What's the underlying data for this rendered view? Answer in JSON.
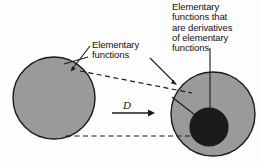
{
  "figure": {
    "background_color": "#fdfdfd",
    "labels": {
      "derivatives": "Elementary\nfunctions that\nare derivatives\nof elementary\nfunctions",
      "elementary": "Elementary\nfunctions",
      "operator": "D"
    },
    "shapes": {
      "left_circle": {
        "name": "Elementary functions",
        "cx": 54,
        "cy": 98,
        "r": 41,
        "fill": "#9a9a9a",
        "stroke": "#1a1a1a"
      },
      "right_circle": {
        "name": "Elementary functions (image set)",
        "cx": 213,
        "cy": 114,
        "r": 42,
        "fill": "#9a9a9a",
        "stroke": "#1a1a1a"
      },
      "inner_circle": {
        "name": "Elementary functions that are derivatives of elementary functions",
        "cx": 209,
        "cy": 127,
        "r": 19,
        "fill": "#1b1b1b",
        "stroke": "#1a1a1a"
      }
    },
    "connectors": {
      "operator_arrow": {
        "name": "D mapping arrow",
        "x1": 112,
        "y1": 113,
        "x2": 152,
        "y2": 113
      },
      "dashed_upper": {
        "name": "upper mapping boundary",
        "x1": 80,
        "y1": 71,
        "x2": 192,
        "y2": 93
      },
      "dashed_lower": {
        "name": "lower mapping boundary",
        "x1": 66,
        "y1": 136,
        "x2": 196,
        "y2": 136
      }
    },
    "colors": {
      "set_fill": "#9a9a9a",
      "subset_fill": "#1b1b1b",
      "stroke": "#1a1a1a",
      "text": "#111111"
    }
  }
}
